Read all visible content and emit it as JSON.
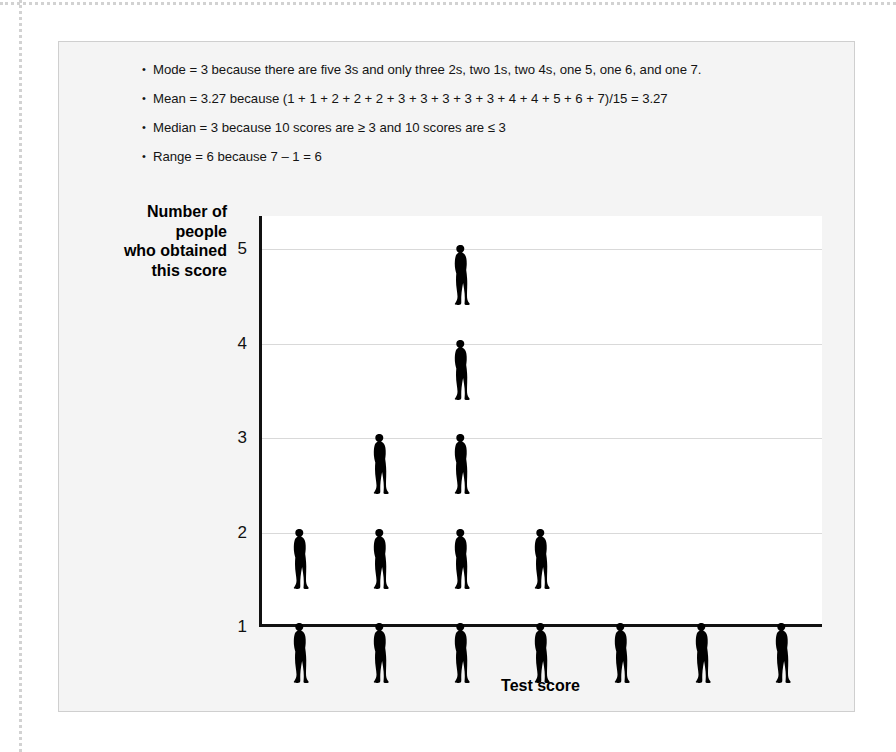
{
  "bullets": [
    "Mode = 3 because there are five 3s and only three 2s, two 1s, two 4s, one 5, one 6, and one 7.",
    "Mean = 3.27 because (1 + 1 + 2 + 2 + 2 + 3 + 3 + 3 + 3 + 3 + 4 + 4 + 5 + 6 + 7)/15 = 3.27",
    "Median = 3 because 10 scores are ≥  3 and 10 scores are ≤ 3",
    "Range = 6 because 7 – 1 = 6"
  ],
  "chart_data": {
    "type": "bar",
    "title": "",
    "xlabel": "Test score",
    "ylabel": "Number of\npeople\nwho obtained\nthis score",
    "ylabel_lines": [
      "Number of",
      "people",
      "who obtained",
      "this score"
    ],
    "categories": [
      "1",
      "2",
      "3",
      "4",
      "5",
      "6",
      "7"
    ],
    "values": [
      2,
      3,
      5,
      2,
      1,
      1,
      1
    ],
    "x": [
      1,
      2,
      3,
      4,
      5,
      6,
      7
    ],
    "yticks": [
      "1",
      "2",
      "3",
      "4",
      "5"
    ],
    "ytick_values": [
      1,
      2,
      3,
      4,
      5
    ],
    "ylim": [
      1,
      5
    ],
    "xlim": [
      0.5,
      7.5
    ],
    "grid": true,
    "legend": "none",
    "marker": "person-pictogram",
    "note": "Pictogram / dot-plot: one human silhouette per person, stacked; head of the nth figure aligns with gridline n."
  },
  "colors": {
    "page_background": "#ffffff",
    "panel_background": "#f4f4f4",
    "plot_background": "#ffffff",
    "axis": "#111111",
    "gridline": "#d9d9d9",
    "figure_silhouette": "#000000",
    "text": "#141414",
    "dotted_rule": "#d2d2d2"
  }
}
